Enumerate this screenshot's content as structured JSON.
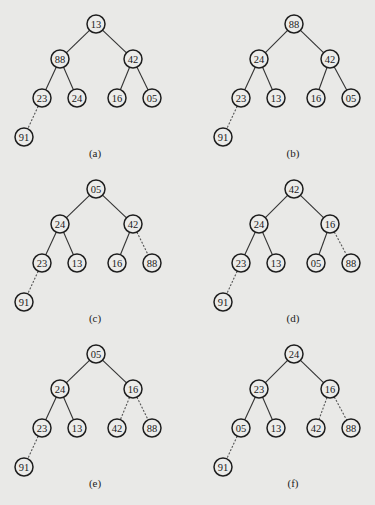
{
  "panels": [
    {
      "caption": "(a)",
      "origin": [
        0,
        0
      ],
      "nodes": [
        {
          "id": "root",
          "value": "13",
          "x": 96,
          "y": 24
        },
        {
          "id": "l",
          "value": "88",
          "x": 60,
          "y": 59
        },
        {
          "id": "r",
          "value": "42",
          "x": 133,
          "y": 59
        },
        {
          "id": "ll",
          "value": "23",
          "x": 42,
          "y": 98
        },
        {
          "id": "lr",
          "value": "24",
          "x": 77,
          "y": 98
        },
        {
          "id": "rl",
          "value": "16",
          "x": 117,
          "y": 98
        },
        {
          "id": "rr",
          "value": "05",
          "x": 152,
          "y": 98
        },
        {
          "id": "lll",
          "value": "91",
          "x": 24,
          "y": 137
        }
      ],
      "edges": [
        {
          "from": "root",
          "to": "l",
          "style": "solid"
        },
        {
          "from": "root",
          "to": "r",
          "style": "solid"
        },
        {
          "from": "l",
          "to": "ll",
          "style": "solid"
        },
        {
          "from": "l",
          "to": "lr",
          "style": "solid"
        },
        {
          "from": "r",
          "to": "rl",
          "style": "solid"
        },
        {
          "from": "r",
          "to": "rr",
          "style": "solid"
        },
        {
          "from": "ll",
          "to": "lll",
          "style": "dashed"
        }
      ],
      "caption_pos": [
        95,
        157
      ]
    },
    {
      "caption": "(b)",
      "origin": [
        0,
        0
      ],
      "nodes": [
        {
          "id": "root",
          "value": "88",
          "x": 294,
          "y": 24
        },
        {
          "id": "l",
          "value": "24",
          "x": 259,
          "y": 59
        },
        {
          "id": "r",
          "value": "42",
          "x": 330,
          "y": 59
        },
        {
          "id": "ll",
          "value": "23",
          "x": 241,
          "y": 98
        },
        {
          "id": "lr",
          "value": "13",
          "x": 276,
          "y": 98
        },
        {
          "id": "rl",
          "value": "16",
          "x": 316,
          "y": 98
        },
        {
          "id": "rr",
          "value": "05",
          "x": 351,
          "y": 98
        },
        {
          "id": "lll",
          "value": "91",
          "x": 223,
          "y": 137
        }
      ],
      "edges": [
        {
          "from": "root",
          "to": "l",
          "style": "solid"
        },
        {
          "from": "root",
          "to": "r",
          "style": "solid"
        },
        {
          "from": "l",
          "to": "ll",
          "style": "solid"
        },
        {
          "from": "l",
          "to": "lr",
          "style": "solid"
        },
        {
          "from": "r",
          "to": "rl",
          "style": "solid"
        },
        {
          "from": "r",
          "to": "rr",
          "style": "solid"
        },
        {
          "from": "ll",
          "to": "lll",
          "style": "dashed"
        }
      ],
      "caption_pos": [
        293,
        157
      ]
    },
    {
      "caption": "(c)",
      "origin": [
        0,
        0
      ],
      "nodes": [
        {
          "id": "root",
          "value": "05",
          "x": 96,
          "y": 189
        },
        {
          "id": "l",
          "value": "24",
          "x": 60,
          "y": 224
        },
        {
          "id": "r",
          "value": "42",
          "x": 133,
          "y": 224
        },
        {
          "id": "ll",
          "value": "23",
          "x": 42,
          "y": 263
        },
        {
          "id": "lr",
          "value": "13",
          "x": 77,
          "y": 263
        },
        {
          "id": "rl",
          "value": "16",
          "x": 117,
          "y": 263
        },
        {
          "id": "rr",
          "value": "88",
          "x": 152,
          "y": 263
        },
        {
          "id": "lll",
          "value": "91",
          "x": 24,
          "y": 302
        }
      ],
      "edges": [
        {
          "from": "root",
          "to": "l",
          "style": "solid"
        },
        {
          "from": "root",
          "to": "r",
          "style": "solid"
        },
        {
          "from": "l",
          "to": "ll",
          "style": "solid"
        },
        {
          "from": "l",
          "to": "lr",
          "style": "solid"
        },
        {
          "from": "r",
          "to": "rl",
          "style": "solid"
        },
        {
          "from": "r",
          "to": "rr",
          "style": "dashed"
        },
        {
          "from": "ll",
          "to": "lll",
          "style": "dashed"
        }
      ],
      "caption_pos": [
        95,
        322
      ]
    },
    {
      "caption": "(d)",
      "origin": [
        0,
        0
      ],
      "nodes": [
        {
          "id": "root",
          "value": "42",
          "x": 294,
          "y": 189
        },
        {
          "id": "l",
          "value": "24",
          "x": 259,
          "y": 224
        },
        {
          "id": "r",
          "value": "16",
          "x": 330,
          "y": 224
        },
        {
          "id": "ll",
          "value": "23",
          "x": 241,
          "y": 263
        },
        {
          "id": "lr",
          "value": "13",
          "x": 276,
          "y": 263
        },
        {
          "id": "rl",
          "value": "05",
          "x": 316,
          "y": 263
        },
        {
          "id": "rr",
          "value": "88",
          "x": 351,
          "y": 263
        },
        {
          "id": "lll",
          "value": "91",
          "x": 223,
          "y": 302
        }
      ],
      "edges": [
        {
          "from": "root",
          "to": "l",
          "style": "solid"
        },
        {
          "from": "root",
          "to": "r",
          "style": "solid"
        },
        {
          "from": "l",
          "to": "ll",
          "style": "solid"
        },
        {
          "from": "l",
          "to": "lr",
          "style": "solid"
        },
        {
          "from": "r",
          "to": "rl",
          "style": "solid"
        },
        {
          "from": "r",
          "to": "rr",
          "style": "dashed"
        },
        {
          "from": "ll",
          "to": "lll",
          "style": "dashed"
        }
      ],
      "caption_pos": [
        293,
        322
      ]
    },
    {
      "caption": "(e)",
      "origin": [
        0,
        0
      ],
      "nodes": [
        {
          "id": "root",
          "value": "05",
          "x": 96,
          "y": 354
        },
        {
          "id": "l",
          "value": "24",
          "x": 60,
          "y": 389
        },
        {
          "id": "r",
          "value": "16",
          "x": 133,
          "y": 389
        },
        {
          "id": "ll",
          "value": "23",
          "x": 42,
          "y": 428
        },
        {
          "id": "lr",
          "value": "13",
          "x": 77,
          "y": 428
        },
        {
          "id": "rl",
          "value": "42",
          "x": 117,
          "y": 428
        },
        {
          "id": "rr",
          "value": "88",
          "x": 152,
          "y": 428
        },
        {
          "id": "lll",
          "value": "91",
          "x": 24,
          "y": 467
        }
      ],
      "edges": [
        {
          "from": "root",
          "to": "l",
          "style": "solid"
        },
        {
          "from": "root",
          "to": "r",
          "style": "solid"
        },
        {
          "from": "l",
          "to": "ll",
          "style": "solid"
        },
        {
          "from": "l",
          "to": "lr",
          "style": "solid"
        },
        {
          "from": "r",
          "to": "rl",
          "style": "dashed"
        },
        {
          "from": "r",
          "to": "rr",
          "style": "dashed"
        },
        {
          "from": "ll",
          "to": "lll",
          "style": "dashed"
        }
      ],
      "caption_pos": [
        95,
        487
      ]
    },
    {
      "caption": "(f)",
      "origin": [
        0,
        0
      ],
      "nodes": [
        {
          "id": "root",
          "value": "24",
          "x": 294,
          "y": 354
        },
        {
          "id": "l",
          "value": "23",
          "x": 259,
          "y": 389
        },
        {
          "id": "r",
          "value": "16",
          "x": 330,
          "y": 389
        },
        {
          "id": "ll",
          "value": "05",
          "x": 241,
          "y": 428
        },
        {
          "id": "lr",
          "value": "13",
          "x": 276,
          "y": 428
        },
        {
          "id": "rl",
          "value": "42",
          "x": 316,
          "y": 428
        },
        {
          "id": "rr",
          "value": "88",
          "x": 351,
          "y": 428
        },
        {
          "id": "lll",
          "value": "91",
          "x": 223,
          "y": 467
        }
      ],
      "edges": [
        {
          "from": "root",
          "to": "l",
          "style": "solid"
        },
        {
          "from": "root",
          "to": "r",
          "style": "solid"
        },
        {
          "from": "l",
          "to": "ll",
          "style": "solid"
        },
        {
          "from": "l",
          "to": "lr",
          "style": "solid"
        },
        {
          "from": "r",
          "to": "rl",
          "style": "dashed"
        },
        {
          "from": "r",
          "to": "rr",
          "style": "dashed"
        },
        {
          "from": "ll",
          "to": "lll",
          "style": "dashed"
        }
      ],
      "caption_pos": [
        293,
        487
      ]
    }
  ],
  "style": {
    "node_radius": 9,
    "background": "#e9e9e7",
    "stroke": "#1e1e1e"
  }
}
